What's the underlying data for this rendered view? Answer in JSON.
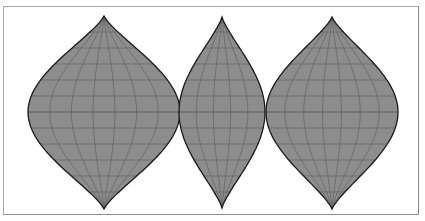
{
  "map": {
    "projection": "interrupted three-lobe projection",
    "colors": {
      "fill": "#8d8d8d",
      "outline": "#1a1a1a",
      "graticule": "#5a5a5a",
      "land_outline": "#a4a4a4",
      "frame": "#a9a9a9",
      "background": "#ffffff"
    },
    "lobes": [
      {
        "name": "left",
        "cx": 104,
        "half_width": 76,
        "top": 16,
        "bottom": 209,
        "equator": 112
      },
      {
        "name": "middle",
        "cx": 222,
        "half_width": 43,
        "top": 17,
        "bottom": 208,
        "equator": 112
      },
      {
        "name": "right",
        "cx": 332,
        "half_width": 66,
        "top": 17,
        "bottom": 209,
        "equator": 112
      }
    ],
    "parallel_spacing_px": 16,
    "meridians_per_lobe": [
      6,
      4,
      6
    ]
  }
}
